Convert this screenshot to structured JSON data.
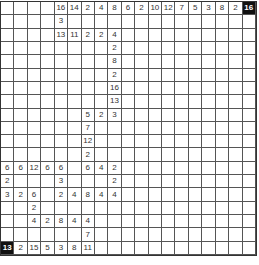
{
  "puzzle": {
    "rows": 19,
    "cols": 19,
    "grid": [
      [
        "",
        "",
        "",
        "",
        "16",
        "14",
        "2",
        "4",
        "8",
        "6",
        "2",
        "10",
        "12",
        "7",
        "5",
        "3",
        "8",
        "2",
        "16"
      ],
      [
        "",
        "",
        "",
        "",
        "3",
        "",
        "",
        "",
        "",
        "",
        "",
        "",
        "",
        "",
        "",
        "",
        "",
        "",
        ""
      ],
      [
        "",
        "",
        "",
        "",
        "13",
        "11",
        "2",
        "2",
        "4",
        "",
        "",
        "",
        "",
        "",
        "",
        "",
        "",
        "",
        ""
      ],
      [
        "",
        "",
        "",
        "",
        "",
        "",
        "",
        "",
        "2",
        "",
        "",
        "",
        "",
        "",
        "",
        "",
        "",
        "",
        ""
      ],
      [
        "",
        "",
        "",
        "",
        "",
        "",
        "",
        "",
        "8",
        "",
        "",
        "",
        "",
        "",
        "",
        "",
        "",
        "",
        ""
      ],
      [
        "",
        "",
        "",
        "",
        "",
        "",
        "",
        "",
        "2",
        "",
        "",
        "",
        "",
        "",
        "",
        "",
        "",
        "",
        ""
      ],
      [
        "",
        "",
        "",
        "",
        "",
        "",
        "",
        "",
        "16",
        "",
        "",
        "",
        "",
        "",
        "",
        "",
        "",
        "",
        ""
      ],
      [
        "",
        "",
        "",
        "",
        "",
        "",
        "",
        "",
        "13",
        "",
        "",
        "",
        "",
        "",
        "",
        "",
        "",
        "",
        ""
      ],
      [
        "",
        "",
        "",
        "",
        "",
        "",
        "5",
        "2",
        "3",
        "",
        "",
        "",
        "",
        "",
        "",
        "",
        "",
        "",
        ""
      ],
      [
        "",
        "",
        "",
        "",
        "",
        "",
        "7",
        "",
        "",
        "",
        "",
        "",
        "",
        "",
        "",
        "",
        "",
        "",
        ""
      ],
      [
        "",
        "",
        "",
        "",
        "",
        "",
        "12",
        "",
        "",
        "",
        "",
        "",
        "",
        "",
        "",
        "",
        "",
        "",
        ""
      ],
      [
        "",
        "",
        "",
        "",
        "",
        "",
        "2",
        "",
        "",
        "",
        "",
        "",
        "",
        "",
        "",
        "",
        "",
        "",
        ""
      ],
      [
        "6",
        "6",
        "12",
        "6",
        "6",
        "",
        "6",
        "4",
        "2",
        "",
        "",
        "",
        "",
        "",
        "",
        "",
        "",
        "",
        ""
      ],
      [
        "2",
        "",
        "",
        "",
        "3",
        "",
        "",
        "",
        "2",
        "",
        "",
        "",
        "",
        "",
        "",
        "",
        "",
        "",
        ""
      ],
      [
        "3",
        "2",
        "6",
        "",
        "2",
        "4",
        "8",
        "4",
        "4",
        "",
        "",
        "",
        "",
        "",
        "",
        "",
        "",
        "",
        ""
      ],
      [
        "",
        "",
        "2",
        "",
        "",
        "",
        "",
        "",
        "",
        "",
        "",
        "",
        "",
        "",
        "",
        "",
        "",
        "",
        ""
      ],
      [
        "",
        "",
        "4",
        "2",
        "8",
        "4",
        "4",
        "",
        "",
        "",
        "",
        "",
        "",
        "",
        "",
        "",
        "",
        "",
        ""
      ],
      [
        "",
        "",
        "",
        "",
        "",
        "",
        "7",
        "",
        "",
        "",
        "",
        "",
        "",
        "",
        "",
        "",
        "",
        "",
        ""
      ],
      [
        "13",
        "2",
        "15",
        "5",
        "3",
        "8",
        "11",
        "",
        "",
        "",
        "",
        "",
        "",
        "",
        "",
        "",
        "",
        "",
        ""
      ]
    ],
    "dark_cells": [
      [
        0,
        18
      ],
      [
        18,
        0
      ]
    ]
  },
  "colors": {
    "dark_cell": "#111111",
    "grid_line": "#555555",
    "text": "#333333"
  }
}
